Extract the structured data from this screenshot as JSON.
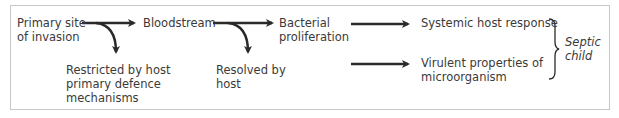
{
  "diagram": {
    "nodes": {
      "primary_site": "Primary site\nof invasion",
      "bloodstream": "Bloodstream",
      "bacterial_proliferation": "Bacterial\nproliferation",
      "restricted": "Restricted by host\nprimary defence\nmechanisms",
      "resolved": "Resolved by\nhost",
      "systemic_response": "Systemic host response",
      "virulent_properties": "Virulent properties of\nmicroorganism",
      "outcome": "Septic\nchild"
    },
    "edges": [
      {
        "from": "primary_site",
        "to": "bloodstream",
        "type": "straight"
      },
      {
        "from": "primary_site",
        "to": "restricted",
        "type": "curved-branch"
      },
      {
        "from": "bloodstream",
        "to": "bacterial_proliferation",
        "type": "straight"
      },
      {
        "from": "bloodstream",
        "to": "resolved",
        "type": "curved-branch"
      },
      {
        "from": "bacterial_proliferation",
        "to": "systemic_response",
        "type": "straight"
      },
      {
        "from": "bacterial_proliferation",
        "to": "virulent_properties",
        "type": "straight"
      },
      {
        "from": [
          "systemic_response",
          "virulent_properties"
        ],
        "to": "outcome",
        "type": "brace"
      }
    ],
    "colors": {
      "text": "#3a3a3a",
      "arrow": "#2a2a2a",
      "border": "#c8c8c8"
    }
  }
}
